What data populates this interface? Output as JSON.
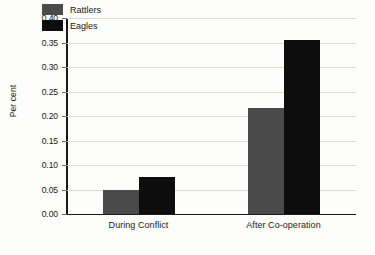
{
  "chart_data": {
    "type": "bar",
    "title": "",
    "xlabel": "",
    "ylabel": "Per cent",
    "categories": [
      "During Conflict",
      "After Co-operation"
    ],
    "series": [
      {
        "name": "Rattlers",
        "color": "#4a4a4a",
        "values": [
          0.049,
          0.217
        ]
      },
      {
        "name": "Eagles",
        "color": "#0d0d0d",
        "values": [
          0.076,
          0.355
        ]
      }
    ],
    "ylim": [
      0.0,
      0.4
    ],
    "ytick_step": 0.05,
    "yticks": [
      "0.00",
      "0.05",
      "0.10",
      "0.15",
      "0.20",
      "0.25",
      "0.30",
      "0.35",
      "0.40"
    ],
    "ytick_values": [
      0.0,
      0.05,
      0.1,
      0.15,
      0.2,
      0.25,
      0.3,
      0.35,
      0.4
    ],
    "grid": true,
    "legend_position": "top-left-inside",
    "background_color": "#fdfdfb",
    "gridline_color": "#d9d9d9",
    "axis_color": "#1a1a1a"
  }
}
